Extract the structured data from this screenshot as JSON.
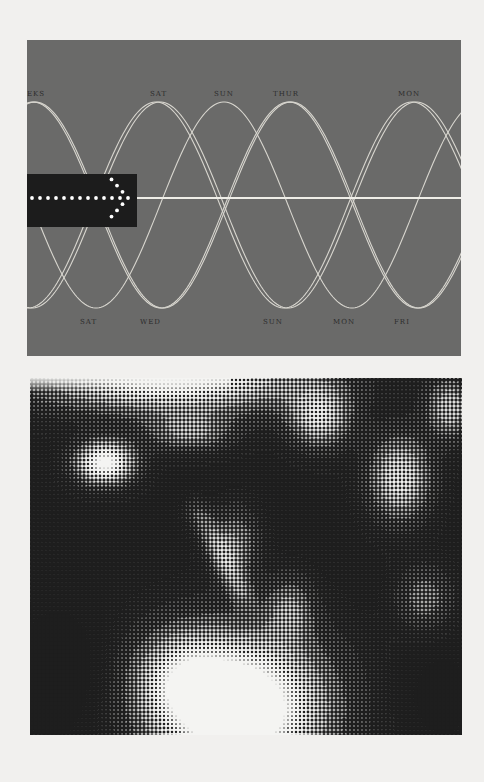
{
  "diagram": {
    "colors": {
      "panel": "#6a6a69",
      "wave": "#d8d6cf",
      "baseline": "#efeee8",
      "arrow_box": "#1c1c1c",
      "arrow_dots": "#ffffff",
      "label": "#2c2c2c"
    },
    "peak_labels": [
      "EKS",
      "SAT",
      "SUN",
      "THUR",
      "MON"
    ],
    "trough_labels": [
      "SAT",
      "WED",
      "SUN",
      "MON",
      "FRI"
    ],
    "arrow": {
      "icon": "dotted-arrow-right-icon",
      "shaft_dot_count": 13,
      "head_dot_count_per_side": 3
    }
  },
  "photo": {
    "description": "Halftone black-and-white photograph of a figure in a light garment with a feathered headdress against foliage",
    "style": "halftone",
    "colors": {
      "ink": "#1e1e1e",
      "paper": "#f4f4f2"
    }
  }
}
